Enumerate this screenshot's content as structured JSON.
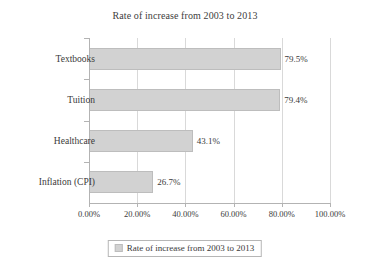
{
  "chart_data": {
    "type": "bar",
    "orientation": "horizontal",
    "title": "Rate of increase from 2003 to 2013",
    "xlabel": "",
    "ylabel": "",
    "categories": [
      "Textbooks",
      "Tuition",
      "Healthcare",
      "Inflation (CPI)"
    ],
    "values": [
      79.5,
      79.4,
      43.1,
      26.7
    ],
    "value_labels": [
      "79.5%",
      "79.4%",
      "43.1%",
      "26.7%"
    ],
    "xlim": [
      0,
      100
    ],
    "xticks": [
      0,
      20,
      40,
      60,
      80,
      100
    ],
    "xtick_labels": [
      "0.00%",
      "20.00%",
      "40.00%",
      "60.00%",
      "80.00%",
      "100.00%"
    ],
    "grid": "vertical",
    "legend": {
      "position": "bottom",
      "entries": [
        {
          "label": "Rate of increase from 2003 to 2013",
          "color": "#d2d2d2"
        }
      ]
    },
    "series": [
      {
        "name": "Rate of increase from 2003 to 2013",
        "color": "#d2d2d2",
        "values": [
          79.5,
          79.4,
          43.1,
          26.7
        ]
      }
    ]
  },
  "colors": {
    "bar_fill": "#d2d2d2",
    "bar_border": "#bdbdbd",
    "axis": "#b3b3b3",
    "grid": "#d9d9d9",
    "text": "#3a3a3a",
    "background": "#ffffff"
  }
}
